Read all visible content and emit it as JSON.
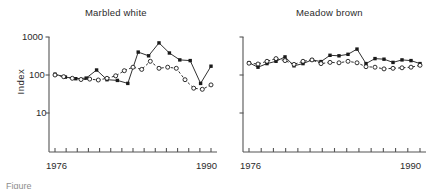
{
  "figure": {
    "caption_fragment": "Figure",
    "ylabel": "Index"
  },
  "panels": [
    {
      "id": "marbled-white",
      "title": "Marbled white",
      "x_start_label": "1976",
      "x_end_label": "1990"
    },
    {
      "id": "meadow-brown",
      "title": "Meadow brown",
      "x_start_label": "1976",
      "x_end_label": "1990"
    }
  ],
  "y_axis": {
    "ticks": [
      "1000",
      "100",
      "10"
    ],
    "tick_values": [
      1000,
      100,
      10
    ],
    "scale": "log",
    "label": "Index"
  },
  "colors": {
    "ink": "#1a1a1a",
    "axis": "#555555",
    "background": "#ffffff"
  },
  "chart_data": [
    {
      "type": "line",
      "title": "Marbled white",
      "xlabel": "",
      "ylabel": "Index",
      "x": [
        1976,
        1977,
        1978,
        1979,
        1980,
        1981,
        1982,
        1983,
        1984,
        1985,
        1986,
        1987,
        1988,
        1989,
        1990
      ],
      "xlim": [
        1976,
        1990
      ],
      "ylim": [
        1,
        1000
      ],
      "yscale": "log",
      "grid": false,
      "legend": "none",
      "series": [
        {
          "name": "filled-square-series",
          "marker": "filled-square",
          "linestyle": "solid",
          "values": [
            105,
            88,
            80,
            83,
            135,
            75,
            72,
            60,
            400,
            320,
            700,
            380,
            250,
            240,
            60,
            170
          ]
        },
        {
          "name": "open-circle-series",
          "marker": "open-circle",
          "linestyle": "dashed",
          "values": [
            100,
            90,
            82,
            76,
            78,
            74,
            82,
            95,
            130,
            160,
            140,
            230,
            150,
            160,
            150,
            75,
            45,
            42,
            55
          ]
        }
      ]
    },
    {
      "type": "line",
      "title": "Meadow brown",
      "xlabel": "",
      "ylabel": "Index",
      "x": [
        1976,
        1977,
        1978,
        1979,
        1980,
        1981,
        1982,
        1983,
        1984,
        1985,
        1986,
        1987,
        1988,
        1989,
        1990
      ],
      "xlim": [
        1976,
        1990
      ],
      "ylim": [
        1,
        1000
      ],
      "yscale": "log",
      "grid": false,
      "legend": "none",
      "series": [
        {
          "name": "filled-square-series",
          "marker": "filled-square",
          "linestyle": "solid",
          "values": [
            210,
            160,
            200,
            230,
            300,
            175,
            200,
            250,
            225,
            330,
            320,
            350,
            480,
            200,
            270,
            260,
            215,
            250,
            240,
            200
          ]
        },
        {
          "name": "open-circle-series",
          "marker": "open-circle",
          "linestyle": "dashed",
          "values": [
            205,
            195,
            230,
            270,
            240,
            190,
            230,
            250,
            200,
            215,
            210,
            230,
            210,
            165,
            160,
            145,
            150,
            155,
            160,
            180
          ]
        }
      ]
    }
  ]
}
